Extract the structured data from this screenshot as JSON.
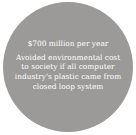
{
  "stat_circle": {
    "headline": "$700 million per year",
    "description_lines": [
      "Avoided environmental cost",
      "to society if all computer",
      "industry's plastic came from",
      "closed loop system"
    ],
    "fill_color": "#9b9a98",
    "text_color": "#ffffff"
  }
}
